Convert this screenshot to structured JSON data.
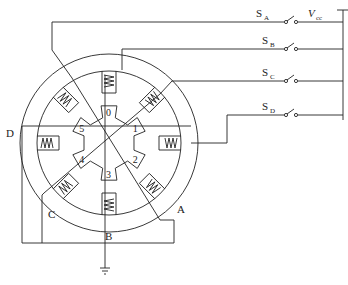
{
  "supply": {
    "label": "V",
    "subscript": "cc"
  },
  "switches": [
    {
      "id": "A",
      "label": "S",
      "subscript": "A"
    },
    {
      "id": "B",
      "label": "S",
      "subscript": "B"
    },
    {
      "id": "C",
      "label": "S",
      "subscript": "C"
    },
    {
      "id": "D",
      "label": "S",
      "subscript": "D"
    }
  ],
  "phases": [
    {
      "id": "A",
      "label": "A"
    },
    {
      "id": "B",
      "label": "B"
    },
    {
      "id": "C",
      "label": "C"
    },
    {
      "id": "D",
      "label": "D"
    }
  ],
  "rotor_teeth": [
    "0",
    "1",
    "2",
    "3",
    "4",
    "5"
  ],
  "stator_poles": 8,
  "ground": "ground-symbol"
}
